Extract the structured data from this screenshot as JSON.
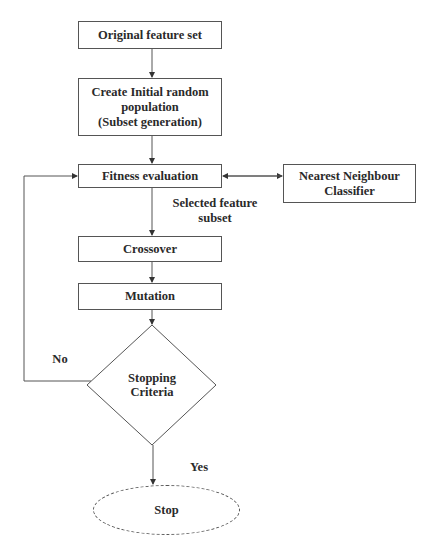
{
  "diagram": {
    "type": "flowchart",
    "nodes": {
      "original": "Original feature set",
      "init_line1": "Create Initial random",
      "init_line2": "population",
      "init_line3": "(Subset generation)",
      "fitness": "Fitness evaluation",
      "nn_line1": "Nearest Neighbour",
      "nn_line2": "Classifier",
      "crossover": "Crossover",
      "mutation": "Mutation",
      "stop_line1": "Stopping",
      "stop_line2": "Criteria",
      "stop": "Stop"
    },
    "edge_labels": {
      "selected_line1": "Selected feature",
      "selected_line2": "subset",
      "no": "No",
      "yes": "Yes"
    },
    "colors": {
      "stroke": "#555555",
      "text": "#2a2a2a",
      "background": "#ffffff"
    }
  }
}
